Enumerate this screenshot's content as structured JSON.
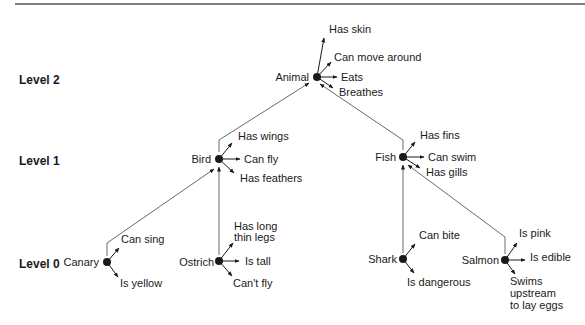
{
  "diagram": {
    "type": "semantic-network",
    "levels": [
      {
        "label": "Level 2",
        "y": 80
      },
      {
        "label": "Level 1",
        "y": 161
      },
      {
        "label": "Level 0",
        "y": 265
      }
    ],
    "nodes": [
      {
        "id": "animal",
        "label": "Animal",
        "x": 317,
        "y": 77,
        "properties": [
          "Has skin",
          "Can move around",
          "Eats",
          "Breathes"
        ]
      },
      {
        "id": "bird",
        "label": "Bird",
        "x": 219,
        "y": 159,
        "properties": [
          "Has wings",
          "Can fly",
          "Has feathers"
        ]
      },
      {
        "id": "fish",
        "label": "Fish",
        "x": 403,
        "y": 157,
        "properties": [
          "Has fins",
          "Can swim",
          "Has gills"
        ]
      },
      {
        "id": "canary",
        "label": "Canary",
        "x": 107,
        "y": 262,
        "properties": [
          "Can sing",
          "Is yellow"
        ]
      },
      {
        "id": "ostrich",
        "label": "Ostrich",
        "x": 219,
        "y": 261,
        "properties": [
          "Has long thin legs",
          "Is tall",
          "Can't fly"
        ]
      },
      {
        "id": "shark",
        "label": "Shark",
        "x": 403,
        "y": 259,
        "properties": [
          "Can bite",
          "Is dangerous"
        ]
      },
      {
        "id": "salmon",
        "label": "Salmon",
        "x": 505,
        "y": 260,
        "properties": [
          "Is pink",
          "Is edible",
          "Swims upstream to lay eggs"
        ]
      }
    ],
    "edges": [
      {
        "from": "bird",
        "to": "animal"
      },
      {
        "from": "fish",
        "to": "animal"
      },
      {
        "from": "canary",
        "to": "bird"
      },
      {
        "from": "ostrich",
        "to": "bird"
      },
      {
        "from": "shark",
        "to": "fish"
      },
      {
        "from": "salmon",
        "to": "fish"
      }
    ],
    "text": {
      "level2": "Level 2",
      "level1": "Level 1",
      "level0": "Level 0",
      "animal": "Animal",
      "animal_p1": "Has skin",
      "animal_p2": "Can move around",
      "animal_p3": "Eats",
      "animal_p4": "Breathes",
      "bird": "Bird",
      "bird_p1": "Has wings",
      "bird_p2": "Can fly",
      "bird_p3": "Has feathers",
      "fish": "Fish",
      "fish_p1": "Has fins",
      "fish_p2": "Can swim",
      "fish_p3": "Has gills",
      "canary": "Canary",
      "canary_p1": "Can sing",
      "canary_p2": "Is yellow",
      "ostrich": "Ostrich",
      "ostrich_p1a": "Has long",
      "ostrich_p1b": "thin legs",
      "ostrich_p2": "Is tall",
      "ostrich_p3": "Can't fly",
      "shark": "Shark",
      "shark_p1": "Can bite",
      "shark_p2": "Is dangerous",
      "salmon": "Salmon",
      "salmon_p1": "Is pink",
      "salmon_p2": "Is edible",
      "salmon_p3a": "Swims",
      "salmon_p3b": "upstream",
      "salmon_p3c": "to lay eggs"
    },
    "colors": {
      "ink": "#1a1a1a",
      "rule": "#555555",
      "edge": "#6a6a6a"
    }
  }
}
